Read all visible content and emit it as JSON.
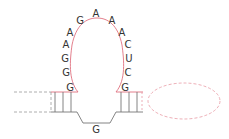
{
  "diagram": {
    "type": "RNA secondary structure (stem-loop / hairpin)",
    "colors": {
      "loop": "#e0707f",
      "stem": "#777777",
      "dashed_gray": "#999999",
      "dashed_pink": "#e89aa5",
      "text": "#333333"
    },
    "loop_nucleotides": [
      {
        "id": "n1",
        "letter": "G",
        "x": 70,
        "y": 91
      },
      {
        "id": "n2",
        "letter": "G",
        "x": 66,
        "y": 76
      },
      {
        "id": "n3",
        "letter": "G",
        "x": 65,
        "y": 62
      },
      {
        "id": "n4",
        "letter": "A",
        "x": 66,
        "y": 48
      },
      {
        "id": "n5",
        "letter": "A",
        "x": 70,
        "y": 36
      },
      {
        "id": "n6",
        "letter": "G",
        "x": 80,
        "y": 24
      },
      {
        "id": "n7",
        "letter": "A",
        "x": 96,
        "y": 17
      },
      {
        "id": "n8",
        "letter": "A",
        "x": 112,
        "y": 24
      },
      {
        "id": "n9",
        "letter": "A",
        "x": 122,
        "y": 36
      },
      {
        "id": "n10",
        "letter": "C",
        "x": 128,
        "y": 48
      },
      {
        "id": "n11",
        "letter": "U",
        "x": 129,
        "y": 62
      },
      {
        "id": "n12",
        "letter": "C",
        "x": 128,
        "y": 76
      },
      {
        "id": "n13",
        "letter": "G",
        "x": 125,
        "y": 91
      }
    ],
    "bulge_nucleotide": {
      "letter": "G",
      "x": 96,
      "y": 133
    },
    "left_stem_pairs": 3,
    "right_stem_pairs": 3
  }
}
